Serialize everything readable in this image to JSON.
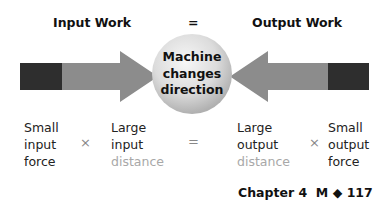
{
  "header": {
    "input_work": "Input Work",
    "equals": "=",
    "output_work": "Output Work"
  },
  "circle": {
    "line1": "Machine",
    "line2": "changes",
    "line3": "direction"
  },
  "colors": {
    "arrow_dark": "#2e2e2e",
    "arrow_light": "#8c8c8c",
    "circle_light": "#f2f2f2",
    "circle_dark": "#bdbdbd",
    "distance_text": "#a8a8a8"
  },
  "equation": {
    "input_force": [
      "Small",
      "input",
      "force"
    ],
    "times1": "×",
    "input_distance": [
      "Large",
      "input",
      "distance"
    ],
    "equals": "=",
    "output_distance": [
      "Large",
      "output",
      "distance"
    ],
    "times2": "×",
    "output_force": [
      "Small",
      "output",
      "force"
    ]
  },
  "footer": {
    "chapter": "Chapter 4",
    "section": "M",
    "diamond": "◆",
    "page": "117"
  }
}
